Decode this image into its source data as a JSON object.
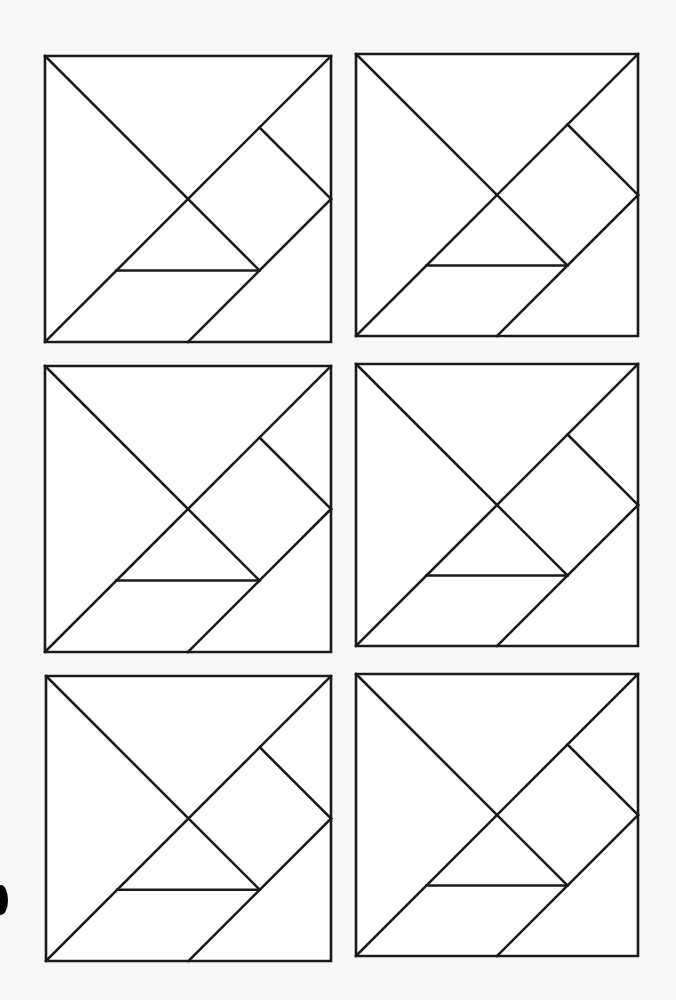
{
  "worksheet": {
    "title": "",
    "stroke_color": "#1a1a1a",
    "stroke_width": 2.6,
    "fill_color": "#ffffff",
    "piece_lines": [
      {
        "name": "outer-square",
        "points": [
          [
            0,
            0
          ],
          [
            1,
            0
          ],
          [
            1,
            1
          ],
          [
            0,
            1
          ],
          [
            0,
            0
          ]
        ]
      },
      {
        "name": "large-triangle-diagonal",
        "points": [
          [
            0,
            0
          ],
          [
            0.75,
            0.75
          ]
        ]
      },
      {
        "name": "main-anti-diagonal",
        "points": [
          [
            0,
            1
          ],
          [
            1,
            0
          ]
        ]
      },
      {
        "name": "square-piece-edge",
        "points": [
          [
            0.75,
            0.25
          ],
          [
            1,
            0.5
          ]
        ]
      },
      {
        "name": "parallelogram-edge",
        "points": [
          [
            1,
            0.5
          ],
          [
            0.5,
            1
          ]
        ]
      },
      {
        "name": "small-triangle-base",
        "points": [
          [
            0.25,
            0.75
          ],
          [
            0.75,
            0.75
          ]
        ]
      }
    ],
    "tangrams": [
      {
        "id": 1,
        "x": 45,
        "y": 56,
        "size": 286
      },
      {
        "id": 2,
        "x": 356,
        "y": 54,
        "size": 282
      },
      {
        "id": 3,
        "x": 45,
        "y": 366,
        "size": 286
      },
      {
        "id": 4,
        "x": 356,
        "y": 364,
        "size": 282
      },
      {
        "id": 5,
        "x": 46,
        "y": 676,
        "size": 285
      },
      {
        "id": 6,
        "x": 356,
        "y": 674,
        "size": 282
      }
    ]
  },
  "marks": {
    "punch_hole": {
      "visible": true
    }
  }
}
